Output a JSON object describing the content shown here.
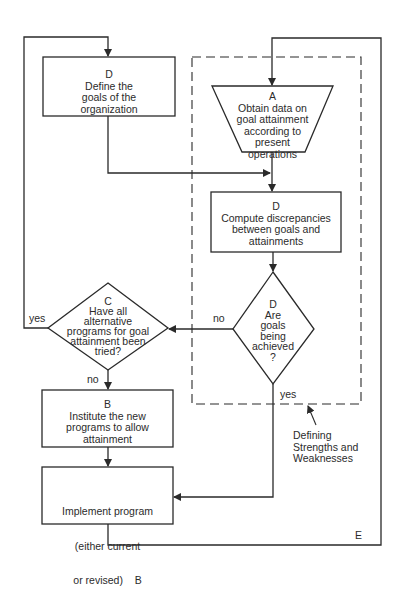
{
  "nodes": {
    "define_goals": {
      "code": "D",
      "lines": [
        "Define the",
        "goals of the",
        "organization"
      ]
    },
    "obtain_data": {
      "code": "A",
      "lines": [
        "Obtain data on",
        "goal attainment",
        "according to",
        "present",
        "operations"
      ]
    },
    "compute_discrepancies": {
      "code": "D",
      "lines": [
        "Compute discrepancies",
        "between goals and",
        "attainments"
      ]
    },
    "goals_achieved": {
      "code": "D",
      "lines": [
        "Are",
        "goals",
        "being",
        "achieved",
        "?"
      ]
    },
    "alternatives_tried": {
      "code": "C",
      "lines": [
        "Have all",
        "alternative",
        "programs for goal",
        "attainment been",
        "tried?"
      ]
    },
    "institute_programs": {
      "code": "B",
      "lines": [
        "Institute the new",
        "programs to allow",
        "attainment"
      ]
    },
    "implement_program": {
      "lines": [
        "Implement program",
        "(either current",
        "or revised)    B"
      ]
    }
  },
  "edge_labels": {
    "achieved_no": "no",
    "achieved_yes": "yes",
    "tried_yes": "yes",
    "tried_no": "no",
    "outer_loop": "E"
  },
  "annotation": {
    "lines": [
      "Defining",
      "Strengths and",
      "Weaknesses"
    ]
  },
  "colors": {
    "line": "#2a2a2a",
    "background": "#ffffff"
  }
}
